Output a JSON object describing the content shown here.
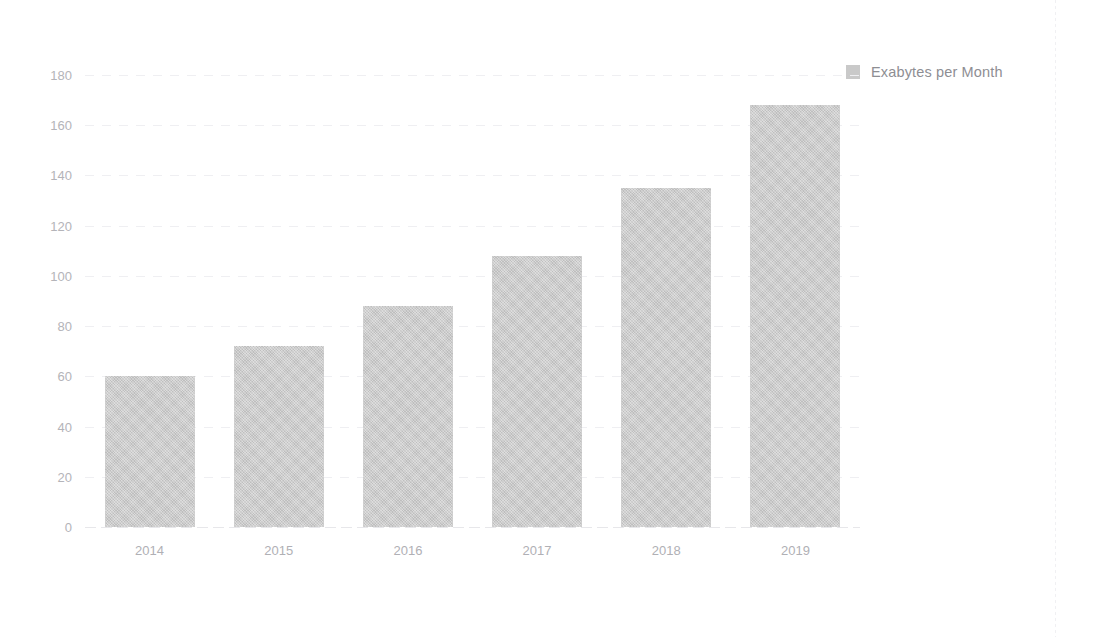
{
  "chart_data": {
    "type": "bar",
    "title": "",
    "xlabel": "",
    "ylabel": "",
    "categories": [
      "2014",
      "2015",
      "2016",
      "2017",
      "2018",
      "2019"
    ],
    "values": [
      60,
      72,
      88,
      108,
      135,
      168
    ],
    "series": [
      {
        "name": "Exabytes per Month",
        "values": [
          60,
          72,
          88,
          108,
          135,
          168
        ],
        "color": "#c9c9c9"
      }
    ],
    "ylim": [
      0,
      180
    ],
    "ytick_values": [
      0,
      20,
      40,
      60,
      80,
      100,
      120,
      140,
      160,
      180
    ],
    "ytick_labels": [
      "0",
      "20",
      "40",
      "60",
      "80",
      "100",
      "120",
      "140",
      "160",
      "180"
    ],
    "grid": true,
    "grid_axis": "y",
    "legend": {
      "position": "top-right",
      "entries": [
        {
          "label": "Exabytes per Month",
          "color": "#c9c9c9",
          "swatch": "square-swatch"
        }
      ]
    },
    "colors": {
      "bar_fill": "#c9c9c9",
      "gridline": "#efeff2",
      "tick_label": "#b4b4b9",
      "legend_label": "#8e8e93",
      "background": "#ffffff"
    }
  }
}
